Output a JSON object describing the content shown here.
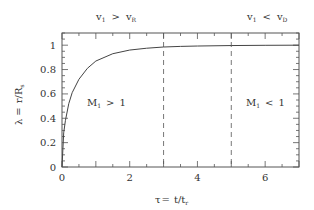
{
  "chart_data": {
    "type": "line",
    "title": "",
    "xlabel": "τ = t/t_r",
    "ylabel": "λ = r/R_s",
    "xlim": [
      0,
      7
    ],
    "ylim": [
      0,
      1.1
    ],
    "xticks": [
      0,
      2,
      4,
      6
    ],
    "xtick_labels": [
      "0",
      "2",
      "4",
      "6"
    ],
    "yticks": [
      0,
      0.2,
      0.4,
      0.6,
      0.8,
      1
    ],
    "ytick_labels": [
      "0",
      "0.2",
      "0.4",
      "0.6",
      "0.8",
      "1"
    ],
    "grid": false,
    "legend": null,
    "series": [
      {
        "name": "lambda(tau)",
        "x": [
          0,
          0.05,
          0.1,
          0.2,
          0.3,
          0.5,
          0.75,
          1.0,
          1.5,
          2.0,
          2.5,
          3.0,
          3.5,
          4.0,
          5.0,
          6.0,
          7.0
        ],
        "y": [
          0,
          0.28,
          0.38,
          0.52,
          0.61,
          0.72,
          0.81,
          0.87,
          0.93,
          0.96,
          0.975,
          0.985,
          0.99,
          0.993,
          0.997,
          0.999,
          1.0
        ]
      }
    ],
    "vlines": [
      {
        "x": 3,
        "style": "dashed"
      },
      {
        "x": 5,
        "style": "dashed"
      }
    ],
    "annotations": [
      {
        "text_main": "v",
        "sub1": "1",
        "op": ">",
        "text2": "v",
        "sub2": "R",
        "position": "top-above-plot-left"
      },
      {
        "text_main": "v",
        "sub1": "1",
        "op": "<",
        "text2": "v",
        "sub2": "D",
        "position": "top-above-plot-right"
      },
      {
        "text_main": "M",
        "sub1": "1",
        "op": ">",
        "text2": "1",
        "position": "left-region"
      },
      {
        "text_main": "M",
        "sub1": "1",
        "op": "<",
        "text2": "1",
        "position": "right-region"
      }
    ]
  },
  "labels": {
    "top_left": {
      "a": "v",
      "a_sub": "1",
      "op": ">",
      "b": "v",
      "b_sub": "R"
    },
    "top_right": {
      "a": "v",
      "a_sub": "1",
      "op": "<",
      "b": "v",
      "b_sub": "D"
    },
    "region_left": {
      "a": "M",
      "a_sub": "1",
      "op": ">",
      "b": "1"
    },
    "region_right": {
      "a": "M",
      "a_sub": "1",
      "op": "<",
      "b": "1"
    },
    "xaxis": {
      "sym": "τ",
      "eq": "=",
      "t": "t/t",
      "sub": "r"
    },
    "yaxis": {
      "sym": "λ",
      "eq": "=",
      "t": "r/R",
      "sub": "s"
    }
  }
}
